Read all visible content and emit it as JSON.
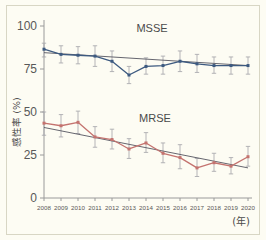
{
  "figure": {
    "background_color": "#fdfcf3",
    "border_color": "#d8d6c4"
  },
  "axis": {
    "y_title": "感性率 (%)",
    "x_unit_label": "(年)",
    "y_ticks": [
      "0",
      "25",
      "50",
      "75",
      "100"
    ],
    "x_ticks": [
      "2008",
      "2009",
      "2010",
      "2011",
      "2012",
      "2013",
      "2014",
      "2015",
      "2016",
      "2017",
      "2018",
      "2019",
      "2020"
    ]
  },
  "labels": {
    "msse": "MSSE",
    "mrse": "MRSE"
  },
  "colors": {
    "msse_line": "#3d5a80",
    "mrse_line": "#c4736f",
    "errorbar": "#a8a8ac",
    "trend": "#555560",
    "axis": "#9a9a9a"
  },
  "chart_data": {
    "type": "line",
    "title": "",
    "xlabel": "(年)",
    "ylabel": "感性率 (%)",
    "xlim": [
      2008,
      2020
    ],
    "ylim": [
      0,
      100
    ],
    "grid": false,
    "legend_position": "inline-annotation",
    "x": [
      2008,
      2009,
      2010,
      2011,
      2012,
      2013,
      2014,
      2015,
      2016,
      2017,
      2018,
      2019,
      2020
    ],
    "series": [
      {
        "name": "MSSE",
        "color": "#3d5a80",
        "values": [
          86.5,
          83.5,
          83.0,
          82.5,
          79.5,
          71.5,
          76.5,
          77.0,
          79.5,
          78.0,
          77.0,
          77.0,
          77.0
        ],
        "err_low": [
          82.0,
          78.5,
          78.0,
          76.5,
          73.5,
          66.5,
          72.0,
          72.0,
          73.5,
          73.0,
          72.5,
          72.0,
          72.0
        ],
        "err_high": [
          90.0,
          88.5,
          88.0,
          88.5,
          85.5,
          76.5,
          81.5,
          82.5,
          85.5,
          83.5,
          82.0,
          82.0,
          82.0
        ],
        "trend_start": 84.5,
        "trend_end": 77.0
      },
      {
        "name": "MRSE",
        "color": "#c4736f",
        "values": [
          43.5,
          42.0,
          44.0,
          35.5,
          34.0,
          28.5,
          32.0,
          26.0,
          23.5,
          17.5,
          20.5,
          18.5,
          24.0
        ],
        "err_low": [
          36.5,
          35.5,
          37.5,
          29.5,
          28.5,
          23.0,
          26.5,
          20.5,
          17.0,
          12.5,
          15.5,
          14.0,
          18.5
        ],
        "err_high": [
          50.0,
          48.5,
          50.5,
          41.5,
          40.0,
          34.5,
          38.0,
          32.0,
          31.0,
          23.0,
          26.0,
          23.5,
          30.0
        ],
        "trend_start": 41.0,
        "trend_end": 17.5
      }
    ]
  }
}
